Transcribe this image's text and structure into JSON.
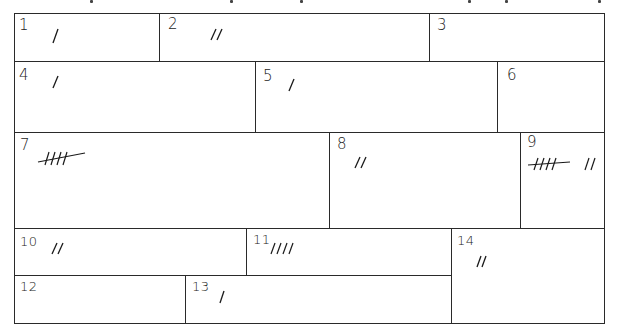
{
  "diagram": {
    "type": "region-tally-grid",
    "regions": [
      {
        "id": "1",
        "label": "1",
        "tally": 1,
        "marks": "/"
      },
      {
        "id": "2",
        "label": "2",
        "tally": 2,
        "marks": "//"
      },
      {
        "id": "3",
        "label": "3",
        "tally": 0,
        "marks": ""
      },
      {
        "id": "4",
        "label": "4",
        "tally": 1,
        "marks": "/"
      },
      {
        "id": "5",
        "label": "5",
        "tally": 1,
        "marks": "/"
      },
      {
        "id": "6",
        "label": "6",
        "tally": 0,
        "marks": ""
      },
      {
        "id": "7",
        "label": "7",
        "tally": 5,
        "marks": "HHH"
      },
      {
        "id": "8",
        "label": "8",
        "tally": 2,
        "marks": "//"
      },
      {
        "id": "9",
        "label": "9",
        "tally": 7,
        "marks": "HHH //"
      },
      {
        "id": "10",
        "label": "10",
        "tally": 2,
        "marks": "//"
      },
      {
        "id": "11",
        "label": "11",
        "tally": 4,
        "marks": "////"
      },
      {
        "id": "12",
        "label": "12",
        "tally": 0,
        "marks": ""
      },
      {
        "id": "13",
        "label": "13",
        "tally": 1,
        "marks": "/"
      },
      {
        "id": "14",
        "label": "14",
        "tally": 2,
        "marks": "//"
      }
    ],
    "colors": {
      "line": "#2a2a2a",
      "ink": "#1a1a1a",
      "background": "#ffffff"
    }
  }
}
